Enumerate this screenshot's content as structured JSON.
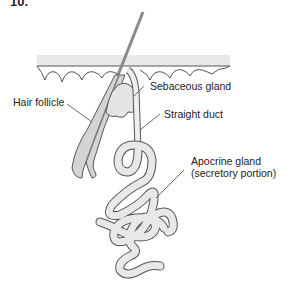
{
  "figure": {
    "number": "10.",
    "colors": {
      "line": "#555555",
      "fill_light": "#e6e6e6",
      "fill_mid": "#d0d0d0",
      "hair": "#8a8a8a",
      "background": "#ffffff"
    }
  },
  "labels": {
    "hair_follicle": "Hair follicle",
    "sebaceous_gland": "Sebaceous gland",
    "straight_duct": "Straight duct",
    "apocrine_gland_line1": "Apocrine gland",
    "apocrine_gland_line2": "(secretory portion)"
  }
}
